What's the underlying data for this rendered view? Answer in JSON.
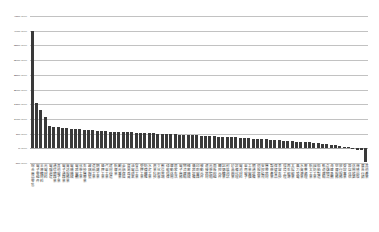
{
  "chart_data": {
    "type": "bar",
    "title": "",
    "subtitle": "",
    "xlabel": "",
    "ylabel": "",
    "ylim": [
      -50,
      450
    ],
    "ytick_step": 50,
    "ytick_labels": [
      "450.0%",
      "400.0%",
      "350.0%",
      "300.0%",
      "250.0%",
      "200.0%",
      "150.0%",
      "100.0%",
      "50.0%",
      "0.0%",
      "-50.0%"
    ],
    "ytick_values": [
      450,
      400,
      350,
      300,
      250,
      200,
      150,
      100,
      50,
      0,
      -50
    ],
    "grid": true,
    "legend": null,
    "legend_position": "none",
    "bar_color": "#3a3a3a",
    "gridline_color": "#9a9a9a",
    "axis_text_color": "#555555",
    "sorted": "descending",
    "categories": [
      "綜合商品零售",
      "電子零組件",
      "半導體材料",
      "光電材料",
      "電腦週邊",
      "通信網路業",
      "其他電子業",
      "電子通路業",
      "資訊服務業",
      "電機機械",
      "電器電纜",
      "化學工業",
      "生技醫療業",
      "玻璃陶瓷",
      "造紙工業",
      "鋼鐵工業",
      "橡膠工業",
      "汽車工業",
      "建材營造",
      "航運業",
      "觀光事業",
      "金融保險",
      "貿易百貨",
      "油電燃氣",
      "食品工業",
      "塑膠工業",
      "紡織纖維",
      "水泥工業",
      "農業科技",
      "文化創意",
      "數位雲端",
      "綠能環保",
      "運動休閒",
      "居家生活",
      "電子商務",
      "物流運輸",
      "精密機械",
      "儀器設備",
      "印刷電路",
      "被動元件",
      "連接器材",
      "光學鏡頭",
      "面板模組",
      "觸控元件",
      "記憶體業",
      "封裝測試",
      "矽晶圓業",
      "設備代理",
      "電池材料",
      "車用電子",
      "工業電腦",
      "網通設備",
      "伺服器業",
      "安控監視",
      "醫療器材",
      "製藥產業",
      "保健食品",
      "美容生技",
      "環境工程",
      "再生能源",
      "太陽能業",
      "風力發電",
      "水資源業",
      "廢棄處理",
      "航太工業",
      "國防工業",
      "船舶製造",
      "軌道運輸",
      "倉儲物流",
      "海運承攬",
      "空運服務",
      "旅行服務",
      "餐飲事業",
      "飯店住宿",
      "休閒娛樂",
      "傳播出版",
      "廣告行銷",
      "其他產業"
    ],
    "values": [
      400.0,
      155.0,
      131.0,
      105.0,
      77.0,
      74.0,
      72.0,
      70.0,
      69.0,
      67.0,
      66.0,
      64.0,
      63.0,
      62.0,
      61.0,
      60.0,
      59.0,
      58.0,
      57.0,
      56.5,
      56.0,
      55.0,
      54.5,
      54.0,
      53.0,
      52.5,
      52.0,
      51.0,
      50.5,
      50.0,
      49.0,
      48.5,
      48.0,
      47.0,
      46.5,
      46.0,
      45.0,
      44.5,
      44.0,
      43.0,
      42.0,
      41.5,
      41.0,
      40.0,
      39.0,
      38.5,
      38.0,
      37.0,
      36.0,
      35.0,
      34.0,
      33.0,
      32.0,
      31.0,
      30.0,
      29.0,
      28.0,
      27.0,
      26.0,
      25.0,
      24.0,
      23.0,
      22.0,
      21.0,
      20.0,
      18.5,
      17.0,
      15.5,
      14.0,
      12.0,
      10.0,
      8.0,
      6.0,
      3.5,
      0.0,
      -6.0,
      -7.0,
      -45.0
    ]
  }
}
